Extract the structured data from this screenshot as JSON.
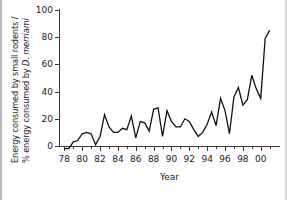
{
  "chart_data": {
    "type": "line",
    "title": "",
    "xlabel": "Year",
    "ylabel_line1": "Energy consumed by small rodents /",
    "ylabel_line2_prefix": "% energy consumed by ",
    "ylabel_line2_italic": "D. merriami",
    "xlim": [
      1977.4,
      2001.6
    ],
    "ylim": [
      -6,
      100
    ],
    "grid": false,
    "legend": null,
    "y_ticks": [
      0,
      20,
      40,
      60,
      80,
      100
    ],
    "y_tick_labels": [
      "0",
      "20",
      "40",
      "60",
      "80",
      "100"
    ],
    "x_ticks": [
      1978,
      1980,
      1982,
      1984,
      1986,
      1988,
      1990,
      1992,
      1994,
      1996,
      1998,
      2000
    ],
    "x_tick_labels": [
      "78",
      "80",
      "82",
      "84",
      "86",
      "88",
      "90",
      "92",
      "94",
      "96",
      "98",
      "00"
    ],
    "x_minor_ticks": [
      1979,
      1981,
      1983,
      1985,
      1987,
      1989,
      1991,
      1993,
      1995,
      1997,
      1999,
      2001
    ],
    "series": [
      {
        "name": "Energy consumed by small rodents as % of D. merriami",
        "color": "#111111",
        "x": [
          1978,
          1978.5,
          1979,
          1979.5,
          1980,
          1980.5,
          1981,
          1981.5,
          1982,
          1982.5,
          1983,
          1983.5,
          1984,
          1984.5,
          1985,
          1985.5,
          1986,
          1986.5,
          1987,
          1987.5,
          1988,
          1988.5,
          1989,
          1989.5,
          1990,
          1990.5,
          1991,
          1991.5,
          1992,
          1992.5,
          1993,
          1993.5,
          1994,
          1994.5,
          1995,
          1995.5,
          1996,
          1996.5,
          1997,
          1997.5,
          1998,
          1998.5,
          1999,
          1999.5,
          2000,
          2000.5,
          2001
        ],
        "values": [
          -2,
          -2,
          3,
          4,
          9,
          10,
          9,
          1,
          7,
          23,
          14,
          10,
          10,
          13,
          12,
          22,
          6,
          18,
          17,
          11,
          27,
          28,
          7,
          26,
          18,
          14,
          14,
          20,
          18,
          12,
          7,
          10,
          16,
          25,
          15,
          35,
          26,
          9,
          36,
          43,
          30,
          34,
          52,
          42,
          35,
          79,
          85
        ]
      }
    ]
  }
}
